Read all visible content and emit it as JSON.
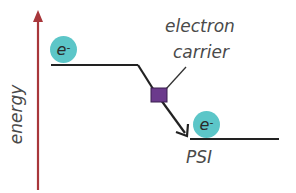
{
  "diagram": {
    "axis": {
      "label": "energy",
      "color": "#a8373b"
    },
    "levels": [
      {
        "name": "top-level",
        "electron": {
          "symbol": "e",
          "charge": "-"
        }
      },
      {
        "name": "psi-level",
        "label": "PSI",
        "electron": {
          "symbol": "e",
          "charge": "-"
        }
      }
    ],
    "carrier": {
      "label_line1": "electron",
      "label_line2": "carrier",
      "color": "#6b3a8c"
    },
    "colors": {
      "electron_fill": "#5cc6c8",
      "line": "#222222",
      "text": "#4a4a4a"
    }
  }
}
